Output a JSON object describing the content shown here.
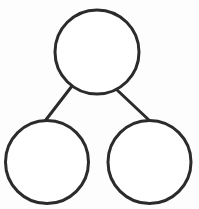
{
  "diagram": {
    "type": "number-bond",
    "stroke_color": "#2b2b2b",
    "fill_color": "#ffffff",
    "background": "#fdfdfd",
    "stroke_width": 3,
    "nodes": [
      {
        "id": "whole",
        "label": "",
        "cx": 97,
        "cy": 52,
        "r": 42
      },
      {
        "id": "part-left",
        "label": "",
        "cx": 47,
        "cy": 162,
        "r": 41.5
      },
      {
        "id": "part-right",
        "label": "",
        "cx": 149.5,
        "cy": 162,
        "r": 41.5
      }
    ],
    "edges": [
      {
        "from": "whole",
        "to": "part-left",
        "x1": 72,
        "y1": 86,
        "x2": 45,
        "y2": 121
      },
      {
        "from": "whole",
        "to": "part-right",
        "x1": 116,
        "y1": 89,
        "x2": 150,
        "y2": 121
      }
    ]
  }
}
